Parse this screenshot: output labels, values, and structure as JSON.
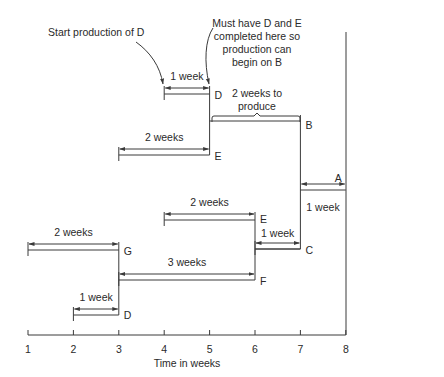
{
  "axis": {
    "label": "Time in weeks",
    "ticks": [
      "1",
      "2",
      "3",
      "4",
      "5",
      "6",
      "7",
      "8"
    ],
    "min": 1,
    "max": 8
  },
  "annotations": {
    "start_d": "Start production of D",
    "must_have_line1": "Must have D and E",
    "must_have_line2": "completed here so",
    "must_have_line3": "production can",
    "must_have_line4": "begin on B",
    "b_duration_line1": "2 weeks to",
    "b_duration_line2": "produce"
  },
  "items": [
    {
      "id": "A",
      "label": "A",
      "start": 7,
      "end": 8,
      "duration_label": "1 week",
      "level": "top"
    },
    {
      "id": "B",
      "label": "B",
      "start": 5,
      "end": 7,
      "duration_label": "2 weeks to produce"
    },
    {
      "id": "C",
      "label": "C",
      "start": 6,
      "end": 7,
      "duration_label": "1 week"
    },
    {
      "id": "D_under_B",
      "label": "D",
      "start": 4,
      "end": 5,
      "duration_label": "1 week"
    },
    {
      "id": "E_under_B",
      "label": "E",
      "start": 3,
      "end": 5,
      "duration_label": "2 weeks"
    },
    {
      "id": "E_under_C",
      "label": "E",
      "start": 4,
      "end": 6,
      "duration_label": "2 weeks"
    },
    {
      "id": "F",
      "label": "F",
      "start": 3,
      "end": 6,
      "duration_label": "3 weeks"
    },
    {
      "id": "G",
      "label": "G",
      "start": 1,
      "end": 3,
      "duration_label": "2 weeks"
    },
    {
      "id": "D_under_F",
      "label": "D",
      "start": 2,
      "end": 3,
      "duration_label": "1 week"
    }
  ]
}
